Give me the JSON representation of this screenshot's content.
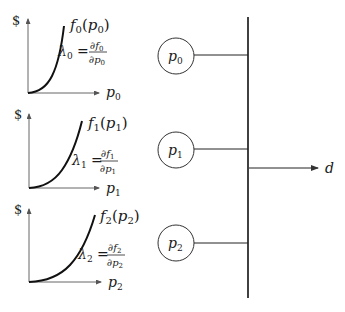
{
  "graphs": [
    {
      "y_axis_label": "$",
      "curve_label": {
        "f": "f",
        "sub": "0",
        "arg": "p",
        "argsub": "0"
      },
      "lambda": {
        "sym": "λ",
        "sub": "0",
        "num": "∂f",
        "numsub": "0",
        "den": "∂p",
        "densub": "0"
      },
      "x_axis_label": {
        "p": "p",
        "sub": "0"
      }
    },
    {
      "y_axis_label": "$",
      "curve_label": {
        "f": "f",
        "sub": "1",
        "arg": "p",
        "argsub": "1"
      },
      "lambda": {
        "sym": "λ",
        "sub": "1",
        "num": "∂f",
        "numsub": "1",
        "den": "∂p",
        "densub": "1"
      },
      "x_axis_label": {
        "p": "p",
        "sub": "1"
      }
    },
    {
      "y_axis_label": "$",
      "curve_label": {
        "f": "f",
        "sub": "2",
        "arg": "p",
        "argsub": "2"
      },
      "lambda": {
        "sym": "λ",
        "sub": "2",
        "num": "∂f",
        "numsub": "2",
        "den": "∂p",
        "densub": "2"
      },
      "x_axis_label": {
        "p": "p",
        "sub": "2"
      }
    }
  ],
  "nodes": [
    {
      "label": "p",
      "sub": "0"
    },
    {
      "label": "p",
      "sub": "1"
    },
    {
      "label": "p",
      "sub": "2"
    }
  ],
  "output": {
    "label": "d"
  },
  "colors": {
    "line": "#1a1a1a",
    "axis": "#555555"
  }
}
